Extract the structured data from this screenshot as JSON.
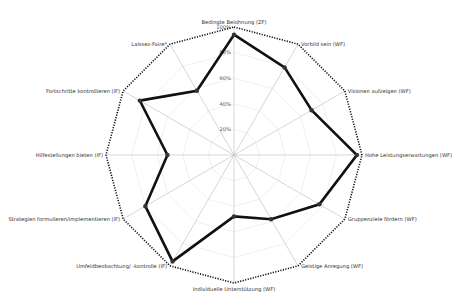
{
  "chart_data": {
    "type": "radar",
    "title": "",
    "axes": [
      "Bedingte Belohnung (ZF)",
      "Vorbild sein (WF)",
      "Visionen aufzeigen (WF)",
      "Hohe Leistungserwartungen (WF)",
      "Gruppenziele fördern (WF)",
      "Geistige Anregung (WF)",
      "Individuelle Unterstützung (WF)",
      "Umfeldbeobachtung/ -kontrolle (IF)",
      "Strategien formulieren/implementieren (IF)",
      "Hilfestellungen bieten (IF)",
      "Fortschritte kontrollieren (IF)",
      "Laissez-Faire*"
    ],
    "series": [
      {
        "name": "Profile",
        "values": [
          94,
          79,
          70,
          96,
          77,
          58,
          48,
          96,
          80,
          52,
          85,
          58
        ],
        "color": "#111111"
      },
      {
        "name": "Maximum",
        "values": [
          100,
          100,
          100,
          100,
          100,
          100,
          100,
          100,
          100,
          100,
          100,
          100
        ],
        "color": "#111111",
        "style": "dotted"
      }
    ],
    "tick_labels": [
      "20%",
      "40%",
      "60%",
      "80%",
      "100%"
    ],
    "rlim": [
      0,
      100
    ],
    "grid": true,
    "legend": "none"
  }
}
